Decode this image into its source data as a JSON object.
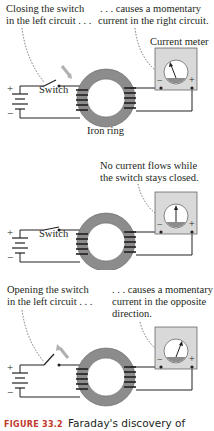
{
  "figure": {
    "caption_number": "FIGURE 33.2",
    "caption_text": "Faraday's discovery of",
    "panels": [
      {
        "state": "closing",
        "left_annotation": [
          "Closing the switch",
          "in the left circuit . . ."
        ],
        "right_annotation": [
          ". . . causes a momentary",
          "current in the right circuit."
        ],
        "meter_label": "Current meter",
        "switch_label": "Switch",
        "ring_label": "Iron ring",
        "meter_zero": "0",
        "needle": "left"
      },
      {
        "state": "closed",
        "right_annotation": [
          "No current flows while",
          "the switch stays closed."
        ],
        "switch_label": "Switch",
        "meter_zero": "0",
        "needle": "center"
      },
      {
        "state": "opening",
        "left_annotation": [
          "Opening the switch",
          "in the left circuit . . ."
        ],
        "right_annotation": [
          ". . . causes a momentary",
          "current in the opposite",
          "direction."
        ],
        "meter_zero": "0",
        "needle": "right"
      }
    ],
    "symbols": {
      "plus": "+",
      "minus": "−"
    },
    "colors": {
      "ring": "#8c8c8c",
      "meter_bg": "#d9d9d9",
      "arrow": "#b0b0b0",
      "caption_accent": "#c0392b"
    }
  }
}
